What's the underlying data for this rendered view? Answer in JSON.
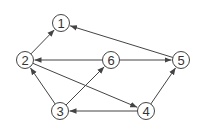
{
  "diagram": {
    "type": "directed-graph",
    "nodes": [
      {
        "id": "1",
        "label": "1",
        "x": 61,
        "y": 23
      },
      {
        "id": "2",
        "label": "2",
        "x": 25,
        "y": 60
      },
      {
        "id": "3",
        "label": "3",
        "x": 60,
        "y": 111
      },
      {
        "id": "4",
        "label": "4",
        "x": 146,
        "y": 111
      },
      {
        "id": "5",
        "label": "5",
        "x": 181,
        "y": 60
      },
      {
        "id": "6",
        "label": "6",
        "x": 111,
        "y": 60
      }
    ],
    "edges": [
      {
        "from": "2",
        "to": "1"
      },
      {
        "from": "5",
        "to": "1"
      },
      {
        "from": "6",
        "to": "2"
      },
      {
        "from": "6",
        "to": "5"
      },
      {
        "from": "3",
        "to": "2"
      },
      {
        "from": "3",
        "to": "6"
      },
      {
        "from": "2",
        "to": "4"
      },
      {
        "from": "4",
        "to": "3"
      },
      {
        "from": "4",
        "to": "5"
      }
    ],
    "colors": {
      "stroke": "#444444",
      "text": "#333333",
      "background": "#ffffff"
    }
  }
}
